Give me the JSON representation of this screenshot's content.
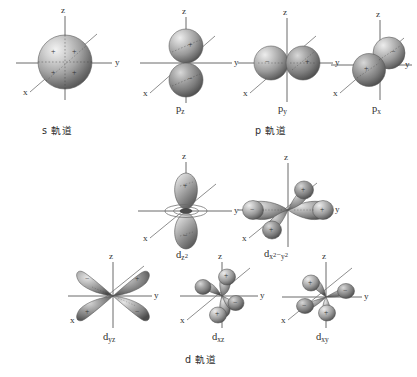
{
  "figure": {
    "title_alt": "Atomic orbital shapes diagram",
    "background_color": "#ffffff",
    "ink_color": "#2e2e2e",
    "axis_color": "#555555",
    "lobe_light": "#e8e8e8",
    "lobe_mid": "#9a9a9a",
    "lobe_dark": "#4a4a4a"
  },
  "axes": {
    "z": "z",
    "y": "y",
    "x": "x"
  },
  "signs": {
    "plus": "+",
    "minus": "−"
  },
  "groups": [
    {
      "id": "s-group",
      "label_prefix": "s",
      "label_jp": "軌道",
      "label_full": "s 軌道"
    },
    {
      "id": "p-group",
      "label_prefix": "p",
      "label_jp": "軌道",
      "label_full": "p 軌道"
    },
    {
      "id": "d-group",
      "label_prefix": "d",
      "label_jp": "軌道",
      "label_full": "d 軌道"
    }
  ],
  "orbitals": [
    {
      "id": "s",
      "name": "s",
      "base": "s",
      "sub": "",
      "sup": "",
      "shape": "sphere",
      "signs": [
        "+",
        "+",
        "+",
        "+"
      ],
      "group": "s-group"
    },
    {
      "id": "pz",
      "name": "p_z",
      "base": "p",
      "sub": "z",
      "sup": "",
      "shape": "dumbbell-vertical",
      "signs": [
        "+",
        "−"
      ],
      "group": "p-group"
    },
    {
      "id": "py",
      "name": "p_y",
      "base": "p",
      "sub": "y",
      "sup": "",
      "shape": "dumbbell-horizontal",
      "signs": [
        "−",
        "+"
      ],
      "group": "p-group"
    },
    {
      "id": "px",
      "name": "p_x",
      "base": "p",
      "sub": "x",
      "sup": "",
      "shape": "dumbbell-diagonal",
      "signs": [
        "+",
        "−"
      ],
      "group": "p-group"
    },
    {
      "id": "dz2",
      "name": "d_z2",
      "base": "d",
      "sub": "z",
      "sup": "2",
      "shape": "dz2-torus",
      "signs": [
        "+",
        "−",
        "−"
      ],
      "group": "d-group"
    },
    {
      "id": "dx2y2",
      "name": "d_x2-y2",
      "base": "d",
      "sub": "x",
      "sup": "2",
      "sub2": "y",
      "sup2": "2",
      "separator": "−",
      "shape": "cloverleaf-axial",
      "signs": [
        "−",
        "+",
        "−",
        "+"
      ],
      "group": "d-group"
    },
    {
      "id": "dyz",
      "name": "d_yz",
      "base": "d",
      "sub": "yz",
      "sup": "",
      "shape": "cloverleaf-diagonal",
      "signs": [
        "−",
        "+",
        "+",
        "−"
      ],
      "group": "d-group"
    },
    {
      "id": "dxz",
      "name": "d_xz",
      "base": "d",
      "sub": "xz",
      "sup": "",
      "shape": "cloverleaf-xz",
      "signs": [
        "+",
        "−",
        "−",
        "+"
      ],
      "group": "d-group"
    },
    {
      "id": "dxy",
      "name": "d_xy",
      "base": "d",
      "sub": "xy",
      "sup": "",
      "shape": "cloverleaf-xy",
      "signs": [
        "+",
        "−",
        "−",
        "+"
      ],
      "group": "d-group"
    }
  ]
}
